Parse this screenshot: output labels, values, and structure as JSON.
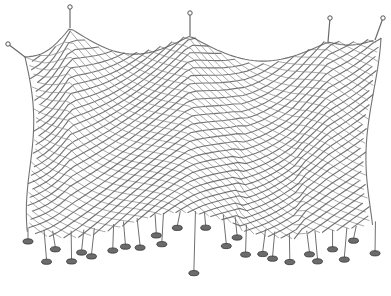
{
  "image": {
    "subject": "Pencil sketch of a hanging fishing net with weighted strands",
    "colors": {
      "background": "#ffffff",
      "ink": "#5a5a5a",
      "ink_light": "#8a8a8a",
      "weight": "#6b6b6b"
    },
    "hanging_points": 5,
    "weights": 26
  }
}
